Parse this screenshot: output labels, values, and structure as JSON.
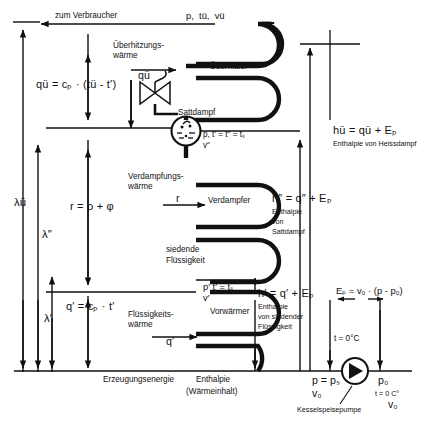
{
  "diagram": {
    "language": "de",
    "stroke_color": "#111111",
    "background_color": "#ffffff"
  },
  "top": {
    "consumer_label": "zum Verbraucher",
    "superheated_state": "p,  tü,  vü"
  },
  "components": {
    "superheater": "Überhitzer",
    "evaporator": "Verdampfer",
    "preheater": "Vorwärmer",
    "drum_label": "Sattdampf",
    "pump_label": "Kesselspeisepumpe"
  },
  "heat_flows": {
    "superheat_heat_line1": "Überhitzungs-",
    "superheat_heat_line2": "wärme",
    "superheat_symbol": "qü",
    "evap_heat_line1": "Verdampfungs-",
    "evap_heat_line2": "wärme",
    "evap_symbol": "r",
    "liquid_heat_line1": "Flüssigkeits-",
    "liquid_heat_line2": "wärme",
    "liquid_symbol": "q′"
  },
  "formulas": {
    "superheat": "qü = cₚ · (tü - t′)",
    "evaporation": "r = ρ + φ",
    "liquid": "q′ = cₚ · t′",
    "h_superheat": "hü = qü + Eₚ",
    "h_sat": "h″ = q″ + Eₚ",
    "h_liquid": "h′ = q′ + Eₚ",
    "pump_work": "Eₚ = v₀ · (p - p₀)"
  },
  "enthalpy_captions": {
    "superheated": "Enthalpie von Heissdampf",
    "saturated_line1": "Enthalpie",
    "saturated_line2": "von",
    "saturated_line3": "Sattdampf",
    "liquid_line1": "Enthalpie",
    "liquid_line2": "von siedender",
    "liquid_line3": "Flüssigkeit"
  },
  "states": {
    "drum_state_line1": "p, t′ = t″ = tₛ",
    "drum_state_line2": "v″",
    "boiling_liquid_line1": "siedende",
    "boiling_liquid_line2": "Flüssigkeit",
    "feed_state_line1": "p′ t′ = tₛ",
    "feed_state_line2": "v′",
    "zero_temp": "t = 0°C",
    "pump_inlet_line1": "p = pₛ",
    "pump_inlet_line2": "v₀",
    "pump_outlet_line1": "p₀",
    "pump_outlet_line2": "t = 0 C°",
    "pump_outlet_line3": "v₀"
  },
  "axes": {
    "lambda_superheat": "λü",
    "lambda_sat": "λ″",
    "lambda_liquid": "λ′",
    "baseline_left": "Erzeugungsenergie",
    "baseline_center_line1": "Enthalpie",
    "baseline_center_line2": "(Wärmeinhalt)"
  }
}
